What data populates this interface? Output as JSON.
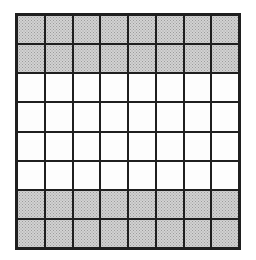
{
  "figure": {
    "grid": {
      "rows": 8,
      "cols": 8,
      "row_shading": [
        "shaded",
        "shaded",
        "white",
        "white",
        "white",
        "white",
        "shaded",
        "shaded"
      ],
      "shaded_cell_count": 32,
      "total_cell_count": 64
    },
    "colors": {
      "background": "#ffffff",
      "grid_line": "#1f1f1f",
      "white_cell": "#fdfdfd",
      "shaded_cell": "#d2d2d2",
      "shaded_dot": "#9c9c9c"
    }
  }
}
